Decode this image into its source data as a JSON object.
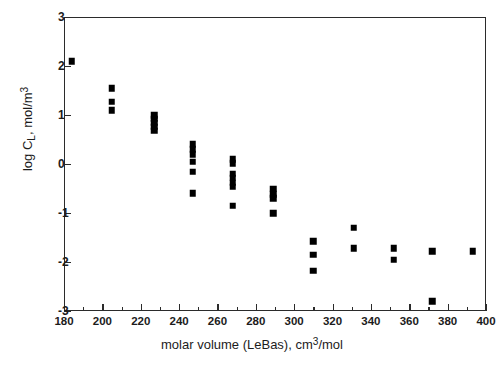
{
  "chart_data": {
    "type": "scatter",
    "title": "",
    "xlabel": "molar volume (LeBas), cm3/mol",
    "xlabel_parts": {
      "pre": "molar volume (LeBas), cm",
      "sup": "3",
      "post": "/mol"
    },
    "ylabel": "log CL, mol/m3",
    "ylabel_parts": {
      "pre": "log C",
      "sub": "L",
      "mid": ", mol/m",
      "sup": "3"
    },
    "xlim": [
      180,
      400
    ],
    "ylim": [
      -3,
      3
    ],
    "xticks": [
      180,
      200,
      220,
      240,
      260,
      280,
      300,
      320,
      340,
      360,
      380,
      400
    ],
    "xticklabels": [
      "180",
      "200",
      "220",
      "240",
      "260",
      "280",
      "300",
      "320",
      "340",
      "360",
      "380",
      "400"
    ],
    "xminorticks": [
      190,
      210,
      230,
      250,
      270,
      290,
      310,
      330,
      350,
      370,
      390
    ],
    "yticks": [
      3,
      2,
      1,
      0,
      -1,
      -2,
      -3
    ],
    "yticklabels": [
      "3",
      "2",
      "1",
      "0",
      "-1",
      "-2",
      "-3"
    ],
    "grid": false,
    "legend": null,
    "marker_style": "filled-square",
    "marker_color": "#000000",
    "points": [
      {
        "x": 184,
        "y": 2.1
      },
      {
        "x": 205,
        "y": 1.55
      },
      {
        "x": 205,
        "y": 1.27
      },
      {
        "x": 205,
        "y": 1.1
      },
      {
        "x": 227,
        "y": 1.0
      },
      {
        "x": 227,
        "y": 0.92
      },
      {
        "x": 227,
        "y": 0.84
      },
      {
        "x": 227,
        "y": 0.76
      },
      {
        "x": 227,
        "y": 0.68
      },
      {
        "x": 247,
        "y": 0.4
      },
      {
        "x": 247,
        "y": 0.3
      },
      {
        "x": 247,
        "y": 0.2
      },
      {
        "x": 247,
        "y": 0.05
      },
      {
        "x": 247,
        "y": -0.16
      },
      {
        "x": 247,
        "y": -0.6
      },
      {
        "x": 268,
        "y": 0.1
      },
      {
        "x": 268,
        "y": 0.02
      },
      {
        "x": 268,
        "y": -0.2
      },
      {
        "x": 268,
        "y": -0.28
      },
      {
        "x": 268,
        "y": -0.38
      },
      {
        "x": 268,
        "y": -0.46
      },
      {
        "x": 268,
        "y": -0.85
      },
      {
        "x": 289,
        "y": -0.5
      },
      {
        "x": 289,
        "y": -0.62
      },
      {
        "x": 289,
        "y": -0.7
      },
      {
        "x": 289,
        "y": -1.0
      },
      {
        "x": 310,
        "y": -1.58
      },
      {
        "x": 310,
        "y": -1.85
      },
      {
        "x": 310,
        "y": -2.18
      },
      {
        "x": 331,
        "y": -1.3
      },
      {
        "x": 331,
        "y": -1.72
      },
      {
        "x": 352,
        "y": -1.72
      },
      {
        "x": 352,
        "y": -1.95
      },
      {
        "x": 372,
        "y": -1.78
      },
      {
        "x": 372,
        "y": -2.8
      },
      {
        "x": 393,
        "y": -1.78
      }
    ]
  }
}
